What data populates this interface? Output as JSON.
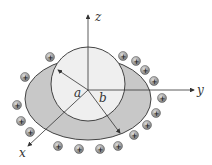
{
  "diagram": {
    "type": "3d-geometry",
    "axes": {
      "z_label": "z",
      "y_label": "y",
      "x_label": "x"
    },
    "labels": {
      "inner_radius": "a",
      "outer_radius": "b"
    },
    "charge_symbol": "+",
    "charge_count": 18,
    "colors": {
      "outer_shell_fill": "#c8c8c8",
      "inner_sphere_fill": "#efefef",
      "outline": "#444444",
      "charge_fill": "#9a9a9a",
      "axis": "#333333"
    }
  }
}
